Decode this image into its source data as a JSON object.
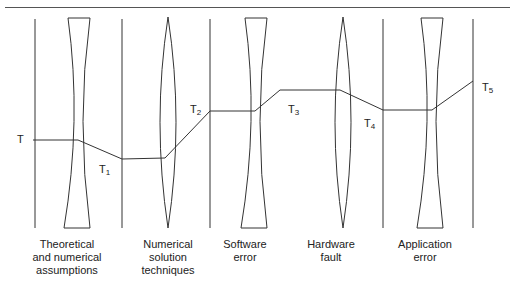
{
  "diagram": {
    "type": "lens-chain",
    "stages": [
      {
        "label_lines": [
          "Theoretical",
          "and numerical",
          "assumptions"
        ],
        "lens": "concave"
      },
      {
        "label_lines": [
          "Numerical",
          "solution",
          "techniques"
        ],
        "lens": "convex"
      },
      {
        "label_lines": [
          "Software",
          "error"
        ],
        "lens": "concave"
      },
      {
        "label_lines": [
          "Hardware",
          "fault"
        ],
        "lens": "convex"
      },
      {
        "label_lines": [
          "Application",
          "error"
        ],
        "lens": "concave"
      }
    ],
    "truth_labels": [
      {
        "base": "T",
        "sub": ""
      },
      {
        "base": "T",
        "sub": "1"
      },
      {
        "base": "T",
        "sub": "2"
      },
      {
        "base": "T",
        "sub": "3"
      },
      {
        "base": "T",
        "sub": "4"
      },
      {
        "base": "T",
        "sub": "5"
      }
    ],
    "colors": {
      "line": "#333333",
      "text": "#222222"
    }
  }
}
